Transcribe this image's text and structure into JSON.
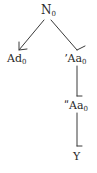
{
  "diagram": {
    "type": "tree",
    "colors": {
      "line": "#3a3a3a",
      "text": "#2a2a2a",
      "background": "#ffffff"
    },
    "nodes": [
      {
        "id": "root",
        "base": "N",
        "subscript": "0"
      },
      {
        "id": "left",
        "base": "Ad",
        "subscript": "0"
      },
      {
        "id": "right",
        "base": "ʼAa",
        "subscript": "0"
      },
      {
        "id": "right-child",
        "base": "ʺAa",
        "subscript": "0"
      },
      {
        "id": "leaf",
        "base": "Y",
        "subscript": ""
      }
    ],
    "edges": [
      {
        "from": "root",
        "to": "left",
        "style": "arrow"
      },
      {
        "from": "root",
        "to": "right",
        "style": "half-arrow"
      },
      {
        "from": "right",
        "to": "right-child",
        "style": "half-arrow"
      },
      {
        "from": "right-child",
        "to": "leaf",
        "style": "half-arrow"
      }
    ]
  }
}
